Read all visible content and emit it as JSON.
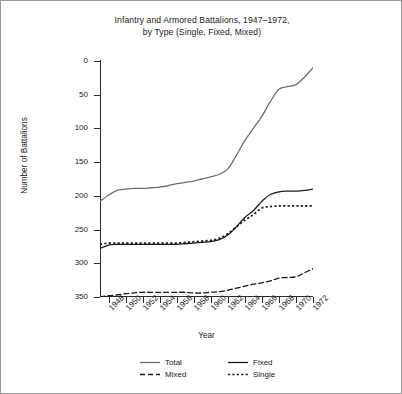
{
  "chart_data": {
    "type": "line",
    "title": "Infantry and Armored Battalions, 1947–1972, by Type (Single, Fixed, Mixed)",
    "title_line1": "Infantry and Armored Battalions, 1947–1972,",
    "title_line2": "by Type (Single, Fixed, Mixed)",
    "xlabel": "Year",
    "ylabel": "Number of Battalions",
    "xlim": [
      1947,
      1972
    ],
    "ylim": [
      0,
      350
    ],
    "y_inverted": true,
    "grid": false,
    "legend_position": "below-axis",
    "ytick_labels": [
      "0",
      "50",
      "100",
      "150",
      "200",
      "250",
      "300",
      "350"
    ],
    "ytick_values": [
      0,
      50,
      100,
      150,
      200,
      250,
      300,
      350
    ],
    "xtick_labels": [
      "1948",
      "1950",
      "1952",
      "1954",
      "1956",
      "1958",
      "1960",
      "1962",
      "1964",
      "1966",
      "1968",
      "1970",
      "1972"
    ],
    "xtick_values": [
      1948,
      1950,
      1952,
      1954,
      1956,
      1958,
      1960,
      1962,
      1964,
      1966,
      1968,
      1970,
      1972
    ],
    "x": [
      1947,
      1948,
      1949,
      1950,
      1951,
      1952,
      1953,
      1954,
      1955,
      1956,
      1957,
      1958,
      1959,
      1960,
      1961,
      1962,
      1963,
      1964,
      1965,
      1966,
      1967,
      1968,
      1969,
      1970,
      1971,
      1972
    ],
    "series": [
      {
        "name": "Total",
        "color": "#6f6f6f",
        "dash": "solid",
        "values": [
          208,
          199,
          192,
          190,
          189,
          189,
          188,
          187,
          185,
          182,
          180,
          178,
          175,
          172,
          168,
          160,
          140,
          118,
          100,
          82,
          60,
          42,
          38,
          35,
          24,
          10
        ]
      },
      {
        "name": "Fixed",
        "color": "#1b1b1b",
        "dash": "solid",
        "values": [
          278,
          273,
          272,
          272,
          272,
          272,
          272,
          272,
          272,
          272,
          271,
          270,
          269,
          268,
          265,
          258,
          246,
          232,
          222,
          208,
          198,
          194,
          193,
          193,
          192,
          190
        ]
      },
      {
        "name": "Single",
        "color": "#1b1b1b",
        "dash": "dotted",
        "values": [
          272,
          270,
          270,
          270,
          270,
          270,
          270,
          270,
          270,
          270,
          269,
          268,
          267,
          266,
          263,
          256,
          246,
          236,
          228,
          218,
          216,
          215,
          215,
          215,
          215,
          215
        ]
      },
      {
        "name": "Mixed",
        "color": "#1b1b1b",
        "dash": "dashed",
        "values": [
          350,
          348,
          347,
          345,
          344,
          343,
          343,
          343,
          343,
          343,
          343,
          344,
          344,
          343,
          342,
          340,
          337,
          334,
          331,
          329,
          326,
          322,
          321,
          320,
          314,
          308
        ]
      }
    ],
    "legend": [
      {
        "label": "Total",
        "color": "#6f6f6f",
        "dash": "solid"
      },
      {
        "label": "Fixed",
        "color": "#1b1b1b",
        "dash": "solid"
      },
      {
        "label": "Mixed",
        "color": "#1b1b1b",
        "dash": "dashed"
      },
      {
        "label": "Single",
        "color": "#1b1b1b",
        "dash": "dotted"
      }
    ]
  }
}
